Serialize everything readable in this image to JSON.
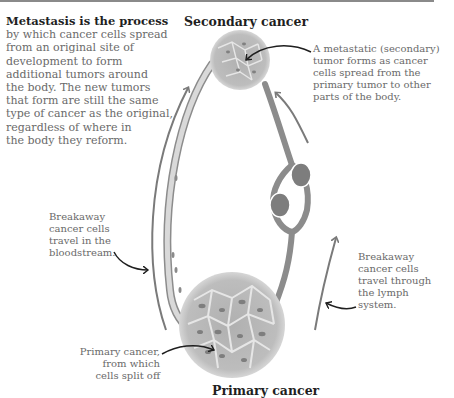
{
  "intro": {
    "heading": "Metastasis is the process",
    "lines": [
      "by which cancer cells spread",
      "from an original site of",
      "development to form",
      "additional tumors around",
      "the body. The new tumors",
      "that form are still the same",
      "type of cancer as the original,",
      "regardless of where in",
      "the body they reform."
    ]
  },
  "titles": {
    "secondary": "Secondary cancer",
    "primary": "Primary cancer"
  },
  "callouts": {
    "secondary": [
      "A metastatic (secondary)",
      "tumor forms as cancer",
      "cells spread from the",
      "primary tumor to other",
      "parts of the body."
    ],
    "bloodstream": [
      "Breakaway",
      "cancer cells",
      "travel in the",
      "bloodstream."
    ],
    "lymph": [
      "Breakaway",
      "cancer cells",
      "travel through",
      "the lymph",
      "system."
    ],
    "primary": [
      "Primary cancer,",
      "from which",
      "cells split off"
    ]
  },
  "colors": {
    "heading": "#1f1f1f",
    "body_text": "#6a6a6a",
    "vessel": "#8c8c8c",
    "tumor_fill": "#b8b8b8",
    "tumor_cell": "#9a9a9a",
    "lymph_node": "#7d7d7d",
    "arrow": "#1f1f1f"
  }
}
